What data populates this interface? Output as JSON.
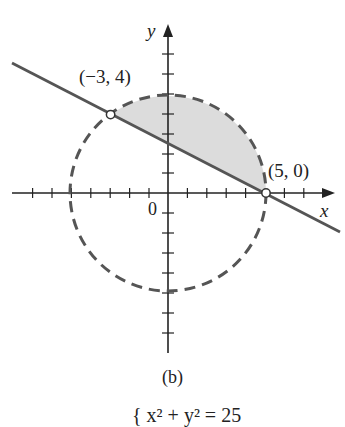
{
  "figure": {
    "caption": "(b)",
    "axis_x_label": "x",
    "axis_y_label": "y",
    "origin_label": "0",
    "points": [
      {
        "label": "(−3, 4)",
        "x": -3,
        "y": 4,
        "marker": "open-circle"
      },
      {
        "label": "(5, 0)",
        "x": 5,
        "y": 0,
        "marker": "open-circle"
      }
    ],
    "curves": [
      {
        "type": "circle",
        "equation": "x^2 + y^2 = 25",
        "center": [
          0,
          0
        ],
        "radius": 5,
        "style": "dashed"
      },
      {
        "type": "line",
        "through": [
          [
            -3,
            4
          ],
          [
            5,
            0
          ]
        ],
        "style": "solid"
      }
    ],
    "shaded_region": "region inside circle and above line, between (-3,4) and (5,0)",
    "x_ticks": [
      -7,
      -6,
      -5,
      -4,
      -3,
      -2,
      -1,
      1,
      2,
      3,
      4,
      5,
      6,
      7
    ],
    "y_ticks": [
      -7,
      -6,
      -5,
      -4,
      -3,
      -2,
      -1,
      1,
      2,
      3,
      4,
      5,
      6,
      7
    ],
    "cut_text": "{ x² + y² = 25"
  },
  "colors": {
    "curve": "#555555",
    "shade": "#dcdcdc",
    "axis": "#222222"
  }
}
